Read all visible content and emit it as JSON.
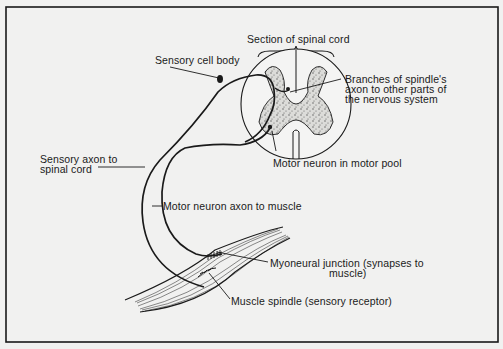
{
  "diagram": {
    "title": "Section of spinal cord",
    "colors": {
      "background": "#f1f1f0",
      "ink": "#1a1a1a",
      "gray_matter": "#d9d9d6"
    },
    "labels": {
      "section_of_spinal_cord": "Section of spinal cord",
      "sensory_cell_body": "Sensory cell body",
      "branches_line1": "Branches of spindle's",
      "branches_line2": "axon to other parts of",
      "branches_line3": "the nervous system",
      "motor_neuron_pool": "Motor neuron in motor pool",
      "sensory_axon_line1": "Sensory axon to",
      "sensory_axon_line2": "spinal cord",
      "motor_axon": "Motor neuron axon to muscle",
      "myoneural_line1": "Myoneural junction (synapses to",
      "myoneural_line2": "muscle)",
      "muscle_spindle": "Muscle spindle (sensory receptor)"
    },
    "components": [
      "spinal-cord-cross-section",
      "gray-matter",
      "sensory-neuron",
      "motor-neuron",
      "muscle",
      "muscle-spindle",
      "myoneural-junction"
    ]
  }
}
